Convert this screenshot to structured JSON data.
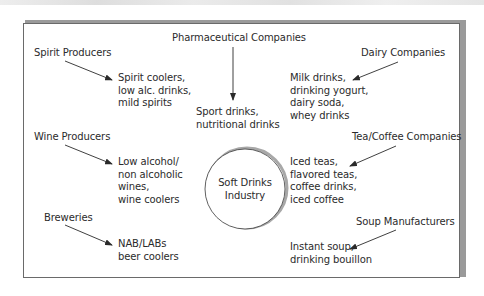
{
  "diagram": {
    "center": {
      "label": "Soft Drinks\nIndustry"
    },
    "sources": [
      {
        "id": "spirit",
        "label": "Spirit Producers",
        "products": "Spirit coolers,\nlow alc. drinks,\nmild spirits"
      },
      {
        "id": "wine",
        "label": "Wine Producers",
        "products": "Low alcohol/\nnon alcoholic\nwines,\nwine coolers"
      },
      {
        "id": "breweries",
        "label": "Breweries",
        "products": "NAB/LABs\nbeer coolers"
      },
      {
        "id": "pharma",
        "label": "Pharmaceutical Companies",
        "products": "Sport drinks,\nnutritional drinks"
      },
      {
        "id": "dairy",
        "label": "Dairy Companies",
        "products": "Milk drinks,\ndrinking yogurt,\ndairy soda,\nwhey drinks"
      },
      {
        "id": "teacoffee",
        "label": "Tea/Coffee Companies",
        "products": "Iced teas,\nflavored teas,\ncoffee drinks,\niced coffee"
      },
      {
        "id": "soup",
        "label": "Soup Manufacturers",
        "products": "Instant soup,\ndrinking bouillon"
      }
    ],
    "colors": {
      "line": "#2a2a2a",
      "frame": "#6a6a6a",
      "shadow": "#9a9a9a"
    }
  }
}
